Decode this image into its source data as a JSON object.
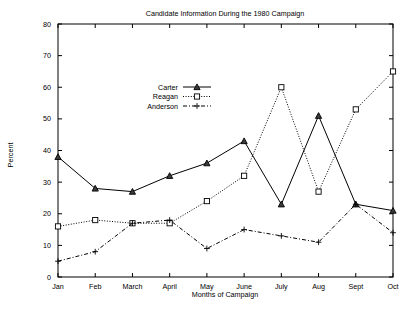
{
  "chart_data": {
    "type": "line",
    "title": "Candidate Information During the 1980 Campaign",
    "xlabel": "Months of Campaign",
    "ylabel": "Percent",
    "categories": [
      "Jan",
      "Feb",
      "March",
      "April",
      "May",
      "June",
      "July",
      "Aug",
      "Sept",
      "Oct"
    ],
    "ylim": [
      0,
      80
    ],
    "yticks": [
      0,
      10,
      20,
      30,
      40,
      50,
      60,
      70,
      80
    ],
    "grid": false,
    "legend_position": "upper-left-inside",
    "series": [
      {
        "name": "Carter",
        "marker": "filled-triangle",
        "linestyle": "solid",
        "values": [
          38,
          28,
          27,
          32,
          36,
          43,
          23,
          51,
          23,
          21
        ]
      },
      {
        "name": "Reagan",
        "marker": "open-square",
        "linestyle": "dotted",
        "values": [
          16,
          18,
          17,
          17,
          24,
          32,
          60,
          27,
          53,
          65
        ]
      },
      {
        "name": "Anderson",
        "marker": "plus",
        "linestyle": "dash-dot",
        "values": [
          5,
          8,
          17,
          18,
          9,
          15,
          13,
          11,
          23,
          14
        ]
      }
    ]
  },
  "axis": {
    "y_tick_labels": [
      "0",
      "10",
      "20",
      "30",
      "40",
      "50",
      "60",
      "70",
      "80"
    ],
    "x_tick_labels": [
      "Jan",
      "Feb",
      "March",
      "April",
      "May",
      "June",
      "July",
      "Aug",
      "Sept",
      "Oct"
    ]
  },
  "legend": {
    "entries": [
      {
        "label": "Carter"
      },
      {
        "label": "Reagan"
      },
      {
        "label": "Anderson"
      }
    ]
  }
}
